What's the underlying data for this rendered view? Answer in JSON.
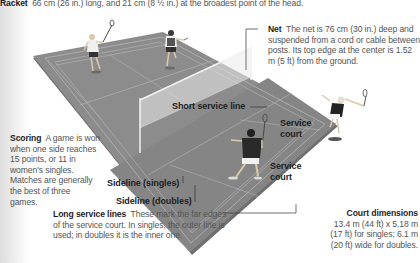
{
  "racket": {
    "title": "Racket",
    "text": "66 cm (26 in.) long, and 21 cm (8 ½ in.) at the broadest point of the head."
  },
  "net": {
    "title": "Net",
    "text": "The net is 76 cm (30 in.) deep and suspended from a cord or cable between posts. Its top edge at the center is 1.52 m (5 ft) from the ground."
  },
  "scoring": {
    "title": "Scoring",
    "text": "A game is won when one side reaches 15 points, or 11 in women's singles. Matches are generally the best of three games."
  },
  "long_service_lines": {
    "title": "Long service lines",
    "text": "These mark the far edges of the service court. In singles, the outer line is used; in doubles it is the inner one."
  },
  "court_dimensions": {
    "title": "Court dimensions",
    "text": "13.4 m (44 ft) x 5.18 m (17 ft) for singles; 6.1 m (20 ft) wide for doubles."
  },
  "labels": {
    "short_service_line": "Short service line",
    "service_court_upper": "Service court",
    "service_court_lower": "Service court",
    "sideline_singles": "Sideline (singles)",
    "sideline_doubles": "Sideline (doubles)"
  },
  "colors": {
    "court": "#8a8a8a",
    "court_shadow": "#6e6e6e",
    "lines": "#b8b8b8",
    "background": "#ffffff",
    "text": "#555555",
    "heading": "#1e1e1e"
  }
}
